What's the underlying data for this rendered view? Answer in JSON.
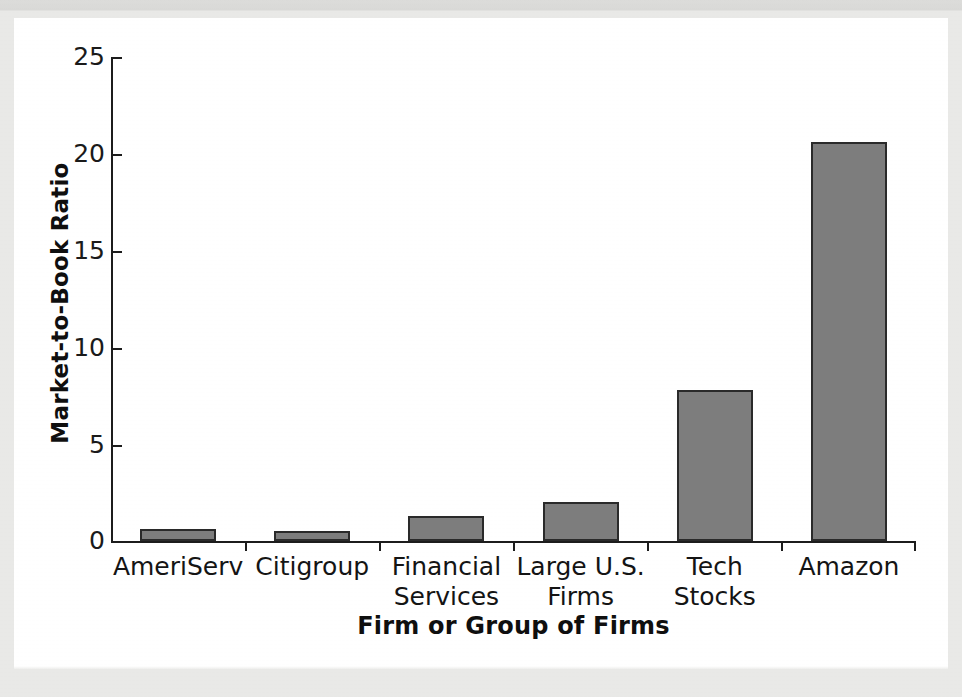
{
  "figure": {
    "background_color": "#ffffff",
    "page_color": "#e9e9e7",
    "bar_fill_color": "#7d7d7d",
    "bar_edge_color": "#2a2a2a",
    "axis_color": "#1c1c1c"
  },
  "chart_data": {
    "type": "bar",
    "title": "",
    "subtitle": "",
    "xlabel": "Firm or Group of Firms",
    "ylabel": "Market-to-Book Ratio",
    "categories": [
      "AmeriServ",
      "Citigroup",
      "Financial\nServices",
      "Large U.S.\nFirms",
      "Tech Stocks",
      "Amazon"
    ],
    "values": [
      0.6,
      0.5,
      1.3,
      2.0,
      7.8,
      20.6
    ],
    "ylim": [
      0,
      25
    ],
    "ytick_labels": [
      "0",
      "5",
      "10",
      "15",
      "20",
      "25"
    ],
    "ytick_values": [
      0,
      5,
      10,
      15,
      20,
      25
    ],
    "grid": false,
    "legend": false,
    "legend_position": "none",
    "series": [
      {
        "name": "Market-to-Book Ratio",
        "values": [
          0.6,
          0.5,
          1.3,
          2.0,
          7.8,
          20.6
        ]
      }
    ]
  },
  "axis_titles": {
    "y": "Market-to-Book Ratio",
    "x": "Firm or Group of Firms"
  }
}
